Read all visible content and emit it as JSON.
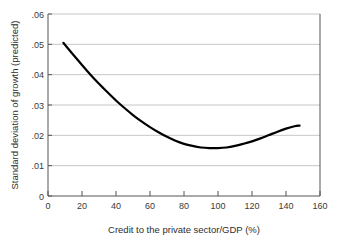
{
  "chart_data": {
    "type": "line",
    "title": "",
    "subtitle": "",
    "xlabel": "Credit to the private sector/GDP (%)",
    "ylabel": "Standard deviation of growth (predicted)",
    "xlim": [
      0,
      160
    ],
    "ylim": [
      0,
      0.06
    ],
    "xticks": [
      0,
      20,
      40,
      60,
      80,
      100,
      120,
      140,
      160
    ],
    "xtick_labels": [
      "0",
      "20",
      "40",
      "60",
      "80",
      "100",
      "120",
      "140",
      "160"
    ],
    "yticks": [
      0,
      0.01,
      0.02,
      0.03,
      0.04,
      0.05,
      0.06
    ],
    "ytick_labels": [
      "0",
      ".01",
      ".02",
      ".03",
      ".04",
      ".05",
      ".06"
    ],
    "grid": "horizontal",
    "legend": "none",
    "annotations": [],
    "series": [
      {
        "name": "Predicted standard deviation of growth",
        "color": "#000000",
        "line_width": 2.2,
        "x": [
          9,
          15,
          20,
          25,
          30,
          35,
          40,
          45,
          50,
          55,
          60,
          65,
          70,
          75,
          80,
          85,
          90,
          95,
          100,
          105,
          110,
          115,
          120,
          125,
          130,
          135,
          140,
          145,
          148
        ],
        "y": [
          0.0505,
          0.0465,
          0.0432,
          0.04,
          0.037,
          0.0342,
          0.0315,
          0.029,
          0.0267,
          0.0246,
          0.0227,
          0.021,
          0.0195,
          0.0182,
          0.0172,
          0.0165,
          0.016,
          0.0158,
          0.0158,
          0.016,
          0.0165,
          0.0172,
          0.018,
          0.019,
          0.0201,
          0.0212,
          0.0222,
          0.023,
          0.0232
        ]
      }
    ],
    "minimum": {
      "x": 97,
      "y": 0.0158
    }
  },
  "axes": {
    "y_axis_name": "y-axis",
    "x_axis_name": "x-axis"
  }
}
